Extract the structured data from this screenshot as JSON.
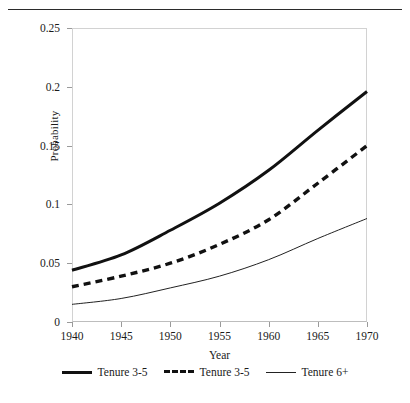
{
  "chart_data": {
    "type": "line",
    "title": "",
    "xlabel": "Year",
    "ylabel": "Probability",
    "xlim": [
      1940,
      1970
    ],
    "ylim": [
      0,
      0.25
    ],
    "grid": false,
    "legend_position": "bottom",
    "x": [
      1940,
      1945,
      1950,
      1955,
      1960,
      1965,
      1970
    ],
    "xticks": [
      "1940",
      "1945",
      "1950",
      "1955",
      "1960",
      "1965",
      "1970"
    ],
    "yticks": [
      "0",
      "0.05",
      "0.1",
      "0.15",
      "0.2",
      "0.25"
    ],
    "ytick_values": [
      0,
      0.05,
      0.1,
      0.15,
      0.2,
      0.25
    ],
    "series": [
      {
        "name": "Tenure 3-5",
        "style": "solid-thick",
        "color": "#111111",
        "values": [
          0.044,
          0.057,
          0.078,
          0.101,
          0.129,
          0.163,
          0.196
        ]
      },
      {
        "name": "Tenure 3-5",
        "style": "dashed",
        "color": "#111111",
        "values": [
          0.03,
          0.039,
          0.05,
          0.066,
          0.087,
          0.118,
          0.15
        ]
      },
      {
        "name": "Tenure 6+",
        "style": "solid-thin",
        "color": "#222222",
        "values": [
          0.015,
          0.02,
          0.029,
          0.039,
          0.053,
          0.071,
          0.088
        ]
      }
    ]
  },
  "axes": {
    "ylabel": "Probability",
    "xlabel": "Year"
  },
  "legend": {
    "items": [
      {
        "label": "Tenure 3-5"
      },
      {
        "label": "Tenure 3-5"
      },
      {
        "label": "Tenure 6+"
      }
    ]
  }
}
